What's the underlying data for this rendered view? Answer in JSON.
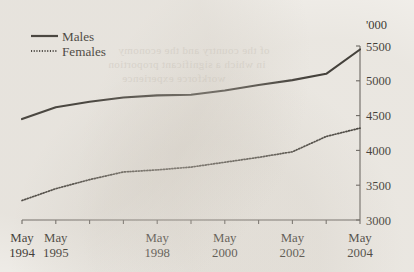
{
  "chart_data": {
    "type": "line",
    "title": "",
    "subtitle": "",
    "xlabel": "",
    "ylabel": "",
    "unit_label": "'000",
    "ylim": [
      3000,
      5500
    ],
    "yticks": [
      3000,
      3500,
      4000,
      4500,
      5000,
      5500
    ],
    "ytick_labels": [
      "3000",
      "3500",
      "4000",
      "4500",
      "5000",
      "5500"
    ],
    "y_axis_position": "right",
    "grid": false,
    "legend_position": "top-left",
    "x_tick_count": 11,
    "xtick_labels": [
      {
        "line1": "May",
        "line2": "1994"
      },
      {
        "line1": "May",
        "line2": "1995"
      },
      {
        "line1": "May",
        "line2": "1998"
      },
      {
        "line1": "May",
        "line2": "2000"
      },
      {
        "line1": "May",
        "line2": "2002"
      },
      {
        "line1": "May",
        "line2": "2004"
      }
    ],
    "x": [
      1994.37,
      1995.37,
      1996.37,
      1997.37,
      1998.37,
      1999.37,
      2000.37,
      2001.37,
      2002.37,
      2003.37,
      2004.37
    ],
    "series": [
      {
        "name": "Males",
        "style": "solid",
        "color": "#15130f",
        "values": [
          4450,
          4620,
          4700,
          4760,
          4790,
          4800,
          4860,
          4940,
          5010,
          5100,
          5450
        ]
      },
      {
        "name": "Females",
        "style": "dotted",
        "color": "#1d1b17",
        "values": [
          3280,
          3450,
          3580,
          3690,
          3720,
          3760,
          3830,
          3900,
          3980,
          4200,
          4320
        ]
      }
    ]
  },
  "legend": {
    "items": [
      {
        "label": "Males",
        "style": "solid"
      },
      {
        "label": "Females",
        "style": "dotted"
      }
    ]
  },
  "bleed_text": {
    "line1": "of the country and the economy",
    "line2": "in which a significant proportion",
    "line3": "workforce experience"
  }
}
